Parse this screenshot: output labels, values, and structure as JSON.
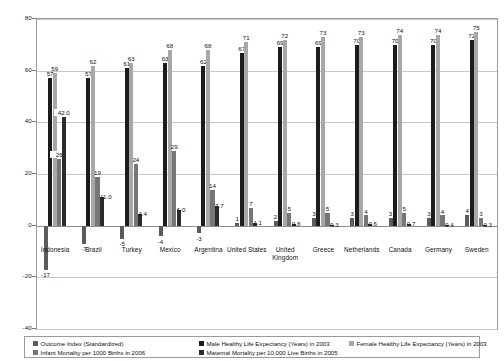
{
  "chart_data": {
    "type": "bar",
    "title": "",
    "subtitle": "",
    "xlabel": "",
    "ylabel": "",
    "ylim": [
      -40,
      80
    ],
    "yticks": [
      80,
      60,
      40,
      20,
      0,
      -20,
      -40
    ],
    "grid": true,
    "legend_position": "bottom",
    "categories": [
      "Indonesia",
      "Brazil",
      "Turkey",
      "Mexico",
      "Argentina",
      "United States",
      "United Kingdom",
      "Greece",
      "Netherlands",
      "Canada",
      "Germany",
      "Sweden"
    ],
    "series": [
      {
        "name": "Outcome Index (Standardized)",
        "color": "#5c5c5c",
        "values": [
          -17,
          -7,
          -5,
          -4,
          -3,
          1,
          2,
          3,
          3,
          3,
          3,
          4
        ],
        "labels": [
          "-17",
          "-7",
          "-5",
          "-4",
          "-3",
          "1",
          "2",
          "3",
          "3",
          "3",
          "3",
          "4"
        ]
      },
      {
        "name": "Male Healthy Life Expectancy (Years) in 2003",
        "color": "#1c1c1c",
        "values": [
          57,
          57,
          61,
          63,
          62,
          67,
          69,
          69,
          70,
          70,
          70,
          72
        ],
        "labels": [
          "57",
          "57",
          "61",
          "63",
          "62",
          "67",
          "69",
          "69",
          "70",
          "70",
          "70",
          "72"
        ]
      },
      {
        "name": "Female Healthy Life Expectancy (Years) in 2003",
        "color": "#a8a8a8",
        "values": [
          59,
          62,
          63,
          68,
          68,
          71,
          72,
          73,
          73,
          74,
          74,
          75
        ],
        "labels": [
          "59",
          "62",
          "63",
          "68",
          "68",
          "71",
          "72",
          "73",
          "73",
          "74",
          "74",
          "75"
        ]
      },
      {
        "name": "Infant Mortality per 1000 Births in 2006",
        "color": "#767676",
        "values": [
          26,
          19,
          24,
          29,
          14,
          7,
          5,
          5,
          4,
          5,
          4,
          3
        ],
        "labels": [
          "26",
          "19",
          "24",
          "29",
          "14",
          "7",
          "5",
          "5",
          "4",
          "5",
          "4",
          "3"
        ]
      },
      {
        "name": "Maternal Mortality per 10,000 Live Births in 2005",
        "color": "#2b2b2b",
        "values": [
          42.0,
          11.0,
          4.4,
          6.0,
          7.7,
          1.1,
          0.8,
          0.3,
          0.6,
          0.7,
          0.4,
          0.3
        ],
        "labels": [
          "42.0",
          "11.0",
          "4.4",
          "6.0",
          "7.7",
          "1.1",
          "0.8",
          "0.3",
          "0.6",
          "0.7",
          "0.4",
          "0.3"
        ]
      }
    ]
  },
  "legend": {
    "items": [
      {
        "label": "Outcome Index (Standardized)",
        "color": "#5c5c5c"
      },
      {
        "label": "Male Healthy Life Expectancy (Years) in 2003",
        "color": "#1c1c1c"
      },
      {
        "label": "Female Healthy Life Expectancy (Years) in 2003",
        "color": "#a8a8a8"
      },
      {
        "label": "Infant Mortality per 1000 Births in 2006",
        "color": "#767676"
      },
      {
        "label": "Maternal Mortality per 10,000 Live Births in 2005",
        "color": "#2b2b2b"
      }
    ]
  }
}
